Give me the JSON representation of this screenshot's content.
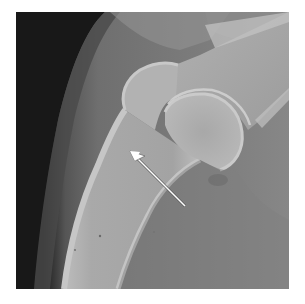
{
  "figure": {
    "type": "radiograph",
    "annotation": {
      "kind": "arrow",
      "color": "#ffffff",
      "tip": [
        130,
        151
      ],
      "tail": [
        185,
        206
      ]
    },
    "colors": {
      "soft_tissue_dark": "#1a1a1a",
      "soft_tissue": "#6e6e6e",
      "background_tissue": "#858585",
      "bone": "#a6a6a6",
      "cortex": "#bdbdbd",
      "border": "#ffffff"
    }
  }
}
